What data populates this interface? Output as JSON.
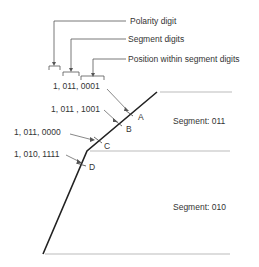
{
  "legend": {
    "polarity_label": "Polarity digit",
    "segment_label": "Segment digits",
    "position_label": "Position within segment digits"
  },
  "points": [
    {
      "id": "A",
      "code": "1, 011, 0001"
    },
    {
      "id": "B",
      "code": "1, 011 , 1001"
    },
    {
      "id": "C",
      "code": "1, 011, 0000"
    },
    {
      "id": "D",
      "code": "1, 010, 1111"
    }
  ],
  "segments": [
    {
      "label": "Segment:  011"
    },
    {
      "label": "Segment:  010"
    }
  ],
  "colors": {
    "curve": "#222222",
    "guide": "#aaaaaa",
    "text": "#333333"
  }
}
